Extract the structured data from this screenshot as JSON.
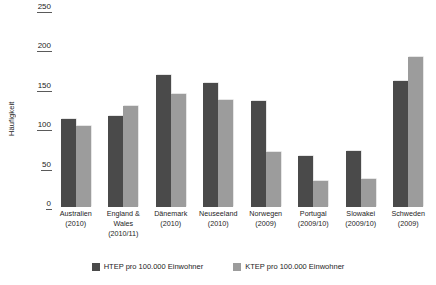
{
  "chart_data": {
    "type": "bar",
    "title": "",
    "xlabel": "",
    "ylabel": "Häufigkeit",
    "ylim": [
      0,
      250
    ],
    "yticks": [
      0,
      50,
      100,
      150,
      200,
      250
    ],
    "grid": false,
    "legend_position": "bottom",
    "categories": [
      "Australien (2010)",
      "England & Wales (2010/11)",
      "Dänemark (2010)",
      "Neuseeland (2010)",
      "Norwegen (2009)",
      "Portugal (2009/10)",
      "Slowakei (2009/10)",
      "Schweden (2009)"
    ],
    "category_lines": [
      [
        "Australien",
        "(2010)"
      ],
      [
        "England &",
        "Wales",
        "(2010/11)"
      ],
      [
        "Dänemark",
        "(2010)"
      ],
      [
        "Neuseeland",
        "(2010)"
      ],
      [
        "Norwegen",
        "(2009)"
      ],
      [
        "Portugal",
        "(2009/10)"
      ],
      [
        "Slowakei",
        "(2009/10)"
      ],
      [
        "Schweden",
        "(2009)"
      ]
    ],
    "series": [
      {
        "name": "HTEP pro 100.000 Einwohner",
        "color": "#4a4a4a",
        "values": [
          112,
          115,
          168,
          158,
          135,
          65,
          71,
          160
        ]
      },
      {
        "name": "KTEP pro 100.000 Einwohner",
        "color": "#9c9c9c",
        "values": [
          103,
          128,
          143,
          136,
          70,
          33,
          36,
          190
        ]
      }
    ]
  }
}
